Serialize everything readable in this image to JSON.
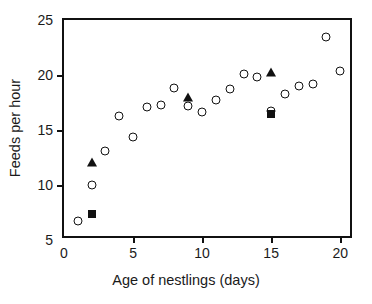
{
  "chart_data": {
    "type": "scatter",
    "title": "",
    "xlabel": "Age of nestlings (days)",
    "ylabel": "Feeds per hour",
    "xlim": [
      0,
      21
    ],
    "ylim": [
      5,
      25
    ],
    "xticks": [
      0,
      5,
      10,
      15,
      20
    ],
    "yticks": [
      5,
      10,
      15,
      20,
      25
    ],
    "xtick_labels": [
      "0",
      "5",
      "10",
      "15",
      "20"
    ],
    "ytick_labels": [
      "5",
      "10",
      "15",
      "20",
      "25"
    ],
    "grid": false,
    "legend": null,
    "series": [
      {
        "name": "open-circle",
        "marker": "circle-open",
        "color": "#111111",
        "points": [
          {
            "x": 1,
            "y": 6.7
          },
          {
            "x": 2,
            "y": 10.0
          },
          {
            "x": 3,
            "y": 13.1
          },
          {
            "x": 4,
            "y": 16.3
          },
          {
            "x": 5,
            "y": 14.4
          },
          {
            "x": 6,
            "y": 17.1
          },
          {
            "x": 7,
            "y": 17.3
          },
          {
            "x": 8,
            "y": 18.8
          },
          {
            "x": 9,
            "y": 17.2
          },
          {
            "x": 10,
            "y": 16.6
          },
          {
            "x": 11,
            "y": 17.7
          },
          {
            "x": 12,
            "y": 18.7
          },
          {
            "x": 13,
            "y": 20.1
          },
          {
            "x": 14,
            "y": 19.8
          },
          {
            "x": 15,
            "y": 16.7
          },
          {
            "x": 16,
            "y": 18.3
          },
          {
            "x": 17,
            "y": 19.0
          },
          {
            "x": 18,
            "y": 19.2
          },
          {
            "x": 19,
            "y": 23.5
          },
          {
            "x": 20,
            "y": 20.4
          }
        ]
      },
      {
        "name": "filled-triangle",
        "marker": "triangle-filled",
        "color": "#111111",
        "points": [
          {
            "x": 2,
            "y": 12.1
          },
          {
            "x": 9,
            "y": 18.0
          },
          {
            "x": 15,
            "y": 20.3
          }
        ]
      },
      {
        "name": "filled-square",
        "marker": "square-filled",
        "color": "#111111",
        "points": [
          {
            "x": 2,
            "y": 7.4
          },
          {
            "x": 15,
            "y": 16.5
          }
        ]
      }
    ]
  }
}
